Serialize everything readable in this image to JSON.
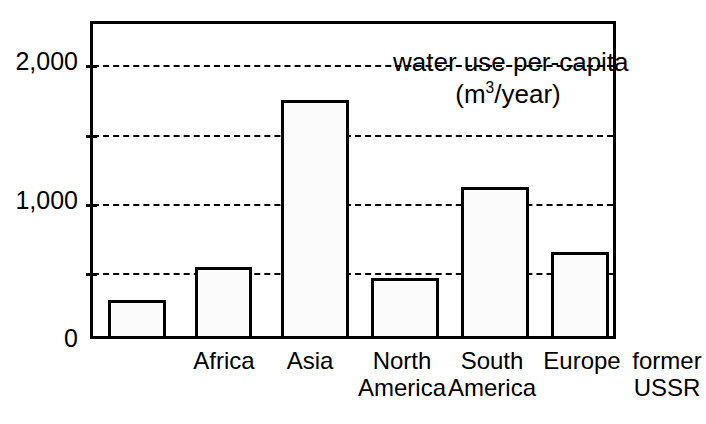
{
  "chart_data": {
    "type": "bar",
    "title": "water use per-capita",
    "subtitle": "(m3/year)",
    "subtitle_prefix": "(m",
    "subtitle_exponent": "3",
    "subtitle_suffix": "/year)",
    "xlabel": "",
    "ylabel": "",
    "ylim": [
      0,
      2300
    ],
    "grid": true,
    "legend": "none",
    "ytick_values": [
      0,
      500,
      1000,
      1500,
      2000
    ],
    "ytick_labels": [
      "0",
      "",
      "1,000",
      "",
      "2,000"
    ],
    "gridline_values": [
      500,
      1000,
      1500,
      2000
    ],
    "categories": [
      "Africa",
      "North\nAmerica",
      "Asia",
      "South\nAmerica",
      "Europe",
      "former\nUSSR"
    ],
    "category_labels": [
      {
        "line1": "Africa",
        "line2": ""
      },
      {
        "line1": "Asia",
        "line2": ""
      },
      {
        "line1": "North",
        "line2": "America"
      },
      {
        "line1": "South",
        "line2": "America"
      },
      {
        "line1": "Europe",
        "line2": ""
      },
      {
        "line1": "former",
        "line2": "USSR"
      }
    ],
    "values": [
      260,
      500,
      1710,
      420,
      1080,
      610
    ],
    "bar_fill": "#fbfbfb",
    "bar_edge": "#000000",
    "axis_color": "#000000"
  },
  "axis": {
    "label_0": "0",
    "label_1000": "1,000",
    "label_2000": "2,000"
  },
  "title": {
    "line1": "water use per-capita",
    "line2_prefix": "(m",
    "line2_exponent": "3",
    "line2_suffix": "/year)"
  },
  "bars": [
    {
      "name": "Africa",
      "value": 260,
      "line1": "Africa",
      "line2": ""
    },
    {
      "name": "Asia",
      "value": 500,
      "line1": "Asia",
      "line2": ""
    },
    {
      "name": "North America",
      "value": 1710,
      "line1": "North",
      "line2": "America"
    },
    {
      "name": "South America",
      "value": 420,
      "line1": "South",
      "line2": "America"
    },
    {
      "name": "Europe",
      "value": 1080,
      "line1": "Europe",
      "line2": ""
    },
    {
      "name": "former USSR",
      "value": 610,
      "line1": "former",
      "line2": "USSR"
    }
  ],
  "layout": {
    "plot_left": 90,
    "plot_top": 21,
    "plot_width": 526,
    "plot_height": 318,
    "baseline_y": 339,
    "value_per_pixel": 7.246,
    "bar_geometry": [
      {
        "left": 15,
        "width": 58
      },
      {
        "left": 102,
        "width": 57
      },
      {
        "left": 188,
        "width": 68
      },
      {
        "left": 278,
        "width": 68
      },
      {
        "left": 368,
        "width": 68
      },
      {
        "left": 458,
        "width": 58
      }
    ],
    "label_geometry": [
      {
        "center": 134
      },
      {
        "center": 220
      },
      {
        "center": 312
      },
      {
        "center": 402
      },
      {
        "center": 492
      },
      {
        "center": 577
      }
    ]
  }
}
